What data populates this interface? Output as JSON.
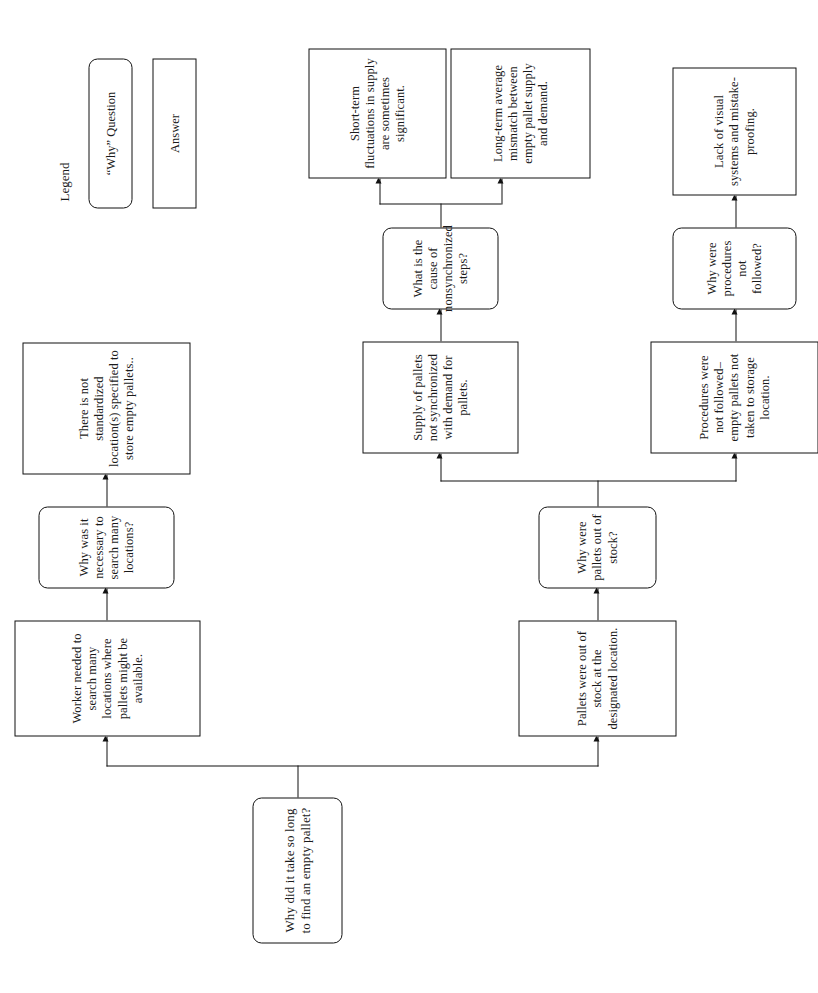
{
  "diagram": {
    "type": "5-whys-root-cause-tree",
    "root": {
      "id": "root",
      "kind": "question",
      "text": "Why did it take so long to find an empty pallet?"
    },
    "nodes": [
      {
        "id": "a1",
        "kind": "answer",
        "text": "Worker needed to search many locations where pallets might be available."
      },
      {
        "id": "q2",
        "kind": "question",
        "text": "Why was it necessary to search many locations?"
      },
      {
        "id": "a2",
        "kind": "answer",
        "text": "There is not standardized location(s) specified to store empty pallets.."
      },
      {
        "id": "a3",
        "kind": "answer",
        "text": "Pallets were out of stock at the designated location."
      },
      {
        "id": "q3",
        "kind": "question",
        "text": "Why were pallets out of stock?"
      },
      {
        "id": "a4",
        "kind": "answer",
        "text": "Supply of pallets not synchronized with demand for pallets."
      },
      {
        "id": "q4",
        "kind": "question",
        "text": "What is the cause of nonsynchronized steps?"
      },
      {
        "id": "a5",
        "kind": "answer",
        "text": "Short-term fluctuations in supply are sometimes significant."
      },
      {
        "id": "a6",
        "kind": "answer",
        "text": "Long-term average mismatch between empty pallet supply and demand."
      },
      {
        "id": "a7",
        "kind": "answer",
        "text": "Procedures were not followed–empty pallets not taken to storage location."
      },
      {
        "id": "q5",
        "kind": "question",
        "text": "Why were procedures not followed?"
      },
      {
        "id": "a8",
        "kind": "answer",
        "text": "Lack of visual systems and mistake-proofing."
      }
    ]
  },
  "legend": {
    "title": "Legend",
    "question_label": "“Why” Question",
    "answer_label": "Answer"
  },
  "colors": {
    "stroke": "#111111",
    "fill": "#ffffff",
    "text": "#1a1a1a"
  }
}
